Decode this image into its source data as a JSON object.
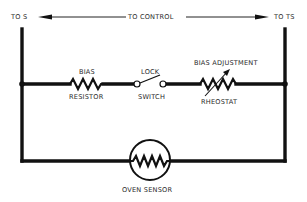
{
  "diagram": {
    "type": "circuit-schematic",
    "top_labels": {
      "left": "TO S",
      "center": "TO CONTROL",
      "right": "TO TS"
    },
    "components": [
      {
        "id": "bias-resistor",
        "label_top": "BIAS",
        "label_bottom": "RESISTOR",
        "symbol": "resistor"
      },
      {
        "id": "lock-switch",
        "label_top": "LOCK",
        "label_bottom": "SWITCH",
        "symbol": "switch"
      },
      {
        "id": "bias-adjustment-rheostat",
        "label_top": "BIAS ADJUSTMENT",
        "label_bottom": "RHEOSTAT",
        "symbol": "rheostat"
      },
      {
        "id": "oven-sensor",
        "label_bottom": "OVEN SENSOR",
        "symbol": "thermistor-circle"
      }
    ],
    "colors": {
      "wire": "#111111",
      "text": "#2a2a2a",
      "background": "#ffffff"
    }
  }
}
